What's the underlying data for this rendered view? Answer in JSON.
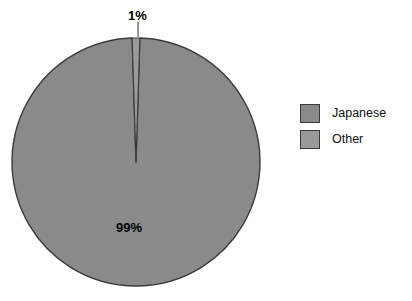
{
  "chart_data": {
    "type": "pie",
    "title": "",
    "categories": [
      "Japanese",
      "Other"
    ],
    "values": [
      99,
      1
    ],
    "labels": [
      "99%",
      "1%"
    ],
    "colors": [
      "#8a8a8a",
      "#9a9a9a"
    ],
    "stroke": "#3a3a3a",
    "legend_position": "right",
    "grid": false,
    "xlabel": "",
    "ylabel": ""
  },
  "chart": {
    "title_remnant": "",
    "slices": [
      {
        "name": "Japanese",
        "value": 99,
        "label": "99%",
        "color": "#8a8a8a",
        "label_x": 136,
        "label_y": 228
      },
      {
        "name": "Other",
        "value": 1,
        "label": "1%",
        "color": "#9a9a9a",
        "label_x": 143,
        "label_y": 16
      }
    ],
    "geometry": {
      "center_x": 136,
      "center_y": 162,
      "radius": 124
    }
  },
  "legend": {
    "items": [
      {
        "label": "Japanese",
        "color": "#8a8a8a"
      },
      {
        "label": "Other",
        "color": "#9a9a9a"
      }
    ]
  }
}
